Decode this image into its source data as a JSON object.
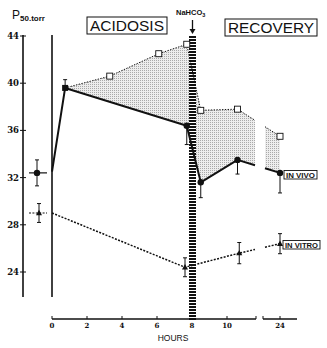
{
  "chart_data": {
    "type": "line",
    "title": "",
    "ylabel": "P50 torr",
    "ylabel_parts": {
      "main": "P",
      "sub": "50.torr"
    },
    "xlabel": "HOURS",
    "ylim": [
      24,
      44
    ],
    "yticks": [
      44,
      40,
      36,
      32,
      28,
      24
    ],
    "xticks": [
      0,
      2,
      4,
      6,
      8,
      10,
      24
    ],
    "x_axis_break": [
      11,
      23
    ],
    "grid": false,
    "legend": "inline boxed labels at right end of curves",
    "phase_labels": {
      "acidosis": "ACIDOSIS",
      "recovery": "RECOVERY"
    },
    "annotation": {
      "main": "NaHCO",
      "sub": "3",
      "x": 8,
      "note": "downward arrow with hatched vertical bar at 8 h"
    },
    "shaded_region": "between upper open-square curve and IN VIVO curve",
    "control": [
      {
        "series": "IN VIVO",
        "v": 32.4,
        "err": 1.1,
        "marker": "filled-circle",
        "hline": "solid"
      },
      {
        "series": "IN VITRO",
        "v": 29.0,
        "err": 0.8,
        "marker": "filled-triangle",
        "hline": "dashed"
      }
    ],
    "series": [
      {
        "name": "IN VIVO",
        "label": "IN VIVO",
        "style": "solid",
        "marker": "filled-circle",
        "points": [
          {
            "h": 0,
            "v": 32.5,
            "marker": "none"
          },
          {
            "h": 0.75,
            "v": 39.6,
            "marker": "filled-square",
            "err": [
              0,
              0.7
            ]
          },
          {
            "h": 7.7,
            "v": 36.4,
            "err": [
              1.6,
              0
            ]
          },
          {
            "h": 8.5,
            "v": 31.6,
            "err": [
              1.3,
              0
            ]
          },
          {
            "h": 10.6,
            "v": 33.5,
            "err": [
              1.2,
              0
            ]
          },
          {
            "h": 24,
            "v": 32.4,
            "err": [
              1.7,
              0
            ]
          }
        ]
      },
      {
        "name": "upper (open squares)",
        "label": "",
        "style": "dotted",
        "marker": "open-square",
        "points": [
          {
            "h": 0.75,
            "v": 39.6,
            "marker": "none"
          },
          {
            "h": 3.3,
            "v": 40.6
          },
          {
            "h": 6.1,
            "v": 42.5
          },
          {
            "h": 7.7,
            "v": 43.3
          },
          {
            "h": 8.5,
            "v": 37.7
          },
          {
            "h": 10.6,
            "v": 37.8
          },
          {
            "h": 24,
            "v": 35.5
          }
        ]
      },
      {
        "name": "IN VITRO",
        "label": "IN VITRO",
        "style": "dashed",
        "marker": "filled-triangle",
        "points": [
          {
            "h": 0,
            "v": 29.0,
            "marker": "none"
          },
          {
            "h": 7.6,
            "v": 24.4,
            "err": [
              0.8,
              0.8
            ]
          },
          {
            "h": 10.7,
            "v": 25.6,
            "err": [
              0.9,
              0.9
            ]
          },
          {
            "h": 24,
            "v": 26.4,
            "err": [
              0.85,
              0.85
            ]
          }
        ]
      }
    ]
  }
}
